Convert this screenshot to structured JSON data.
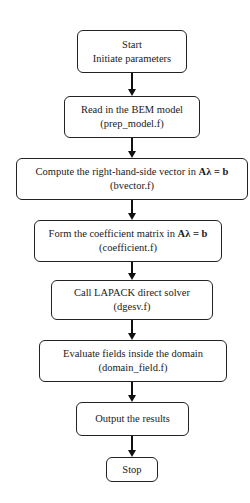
{
  "flowchart": {
    "steps": [
      {
        "id": "start",
        "line1": "Start",
        "line2": "Initiate parameters"
      },
      {
        "id": "read",
        "line1": "Read in the BEM model",
        "line2": "(prep_model.f)"
      },
      {
        "id": "compute",
        "line1_prefix": "Compute the right-hand-side vector in ",
        "line1_eq": "Aλ = b",
        "line2": "(bvector.f)"
      },
      {
        "id": "form",
        "line1_prefix": "Form the coefficient matrix in ",
        "line1_eq": "Aλ = b",
        "line2": "(coefficient.f)"
      },
      {
        "id": "solve",
        "line1": "Call LAPACK direct solver",
        "line2": "(dgesv.f)"
      },
      {
        "id": "evaluate",
        "line1": "Evaluate fields inside the domain",
        "line2": "(domain_field.f)"
      },
      {
        "id": "output",
        "line1": "Output the results"
      },
      {
        "id": "stop",
        "line1": "Stop"
      }
    ],
    "colors": {
      "stroke": "#222222",
      "background": "#ffffff",
      "text": "#1a1a1a"
    }
  }
}
